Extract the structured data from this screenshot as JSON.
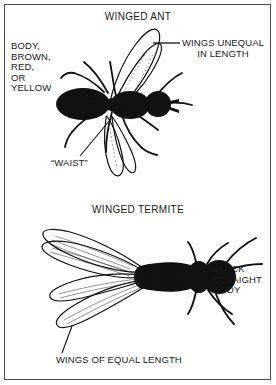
{
  "figure": {
    "background_color": "#ffffff",
    "ink_color": "#111111",
    "border_color": "#4a4a4a"
  },
  "panels": [
    {
      "id": "winged-ant",
      "title": "WINGED ANT",
      "callouts": [
        {
          "id": "body-color",
          "text": "BODY,\nBROWN,\nRED,\nOR\nYELLOW",
          "leader": "none"
        },
        {
          "id": "wings-unequal",
          "text": "WINGS UNEQUAL\nIN LENGTH",
          "leader": "horizontal-dash-left"
        },
        {
          "id": "waist",
          "text": "“WAIST”",
          "leader": "diagonal-up-right"
        }
      ]
    },
    {
      "id": "winged-termite",
      "title": "WINGED TERMITE",
      "callouts": [
        {
          "id": "black-straight-body",
          "text": "BLACK\nSTRAIGHT\nBODY",
          "leader": "horizontal-dash-left"
        },
        {
          "id": "wings-equal",
          "text": "WINGS OF EQUAL LENGTH",
          "leader": "diagonal-up-right"
        }
      ]
    }
  ]
}
